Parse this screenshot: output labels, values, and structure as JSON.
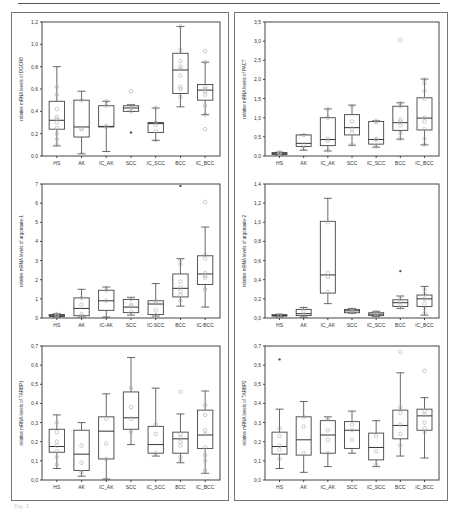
{
  "figure": {
    "caption": "Fig. 1",
    "categories": [
      "HS",
      "AK",
      "IC_AK",
      "SCC",
      "IC_SCC",
      "BCC",
      "IC_BCC"
    ]
  },
  "chart_data": [
    {
      "type": "box",
      "id": "p1",
      "ylabel": "relative mRNA levels of DGCR8",
      "ylim": [
        0,
        1.2
      ],
      "yticks": [
        "0,0",
        "0,2",
        "0,4",
        "0,6",
        "0,8",
        "1,0",
        "1,2"
      ],
      "categories": [
        "HS",
        "AK",
        "IC_AK",
        "SCC",
        "IC_SCC",
        "BCC",
        "IC_BCC"
      ],
      "boxes": [
        {
          "min": 0.09,
          "q1": 0.24,
          "median": 0.32,
          "q3": 0.49,
          "max": 0.8,
          "points": [
            0.1,
            0.15,
            0.2,
            0.25,
            0.3,
            0.33,
            0.35,
            0.42,
            0.55,
            0.62
          ],
          "outliers": []
        },
        {
          "min": 0.02,
          "q1": 0.17,
          "median": 0.26,
          "q3": 0.5,
          "max": 0.58,
          "points": [
            0.02,
            0.24,
            0.25,
            0.5
          ],
          "outliers": []
        },
        {
          "min": 0.04,
          "q1": 0.26,
          "median": 0.265,
          "q3": 0.45,
          "max": 0.49,
          "points": [
            0.26,
            0.27,
            0.45,
            0.49
          ],
          "outliers": []
        },
        {
          "min": 0.4,
          "q1": 0.4,
          "median": 0.43,
          "q3": 0.45,
          "max": 0.46,
          "points": [
            0.4,
            0.43,
            0.45,
            0.58
          ],
          "outliers": [
            0.21
          ]
        },
        {
          "min": 0.14,
          "q1": 0.21,
          "median": 0.29,
          "q3": 0.3,
          "max": 0.43,
          "points": [
            0.14,
            0.22,
            0.28,
            0.3,
            0.43
          ],
          "outliers": []
        },
        {
          "min": 0.44,
          "q1": 0.56,
          "median": 0.77,
          "q3": 0.92,
          "max": 1.16,
          "points": [
            0.53,
            0.6,
            0.62,
            0.72,
            0.78,
            0.8,
            0.85,
            0.95,
            1.16
          ],
          "outliers": []
        },
        {
          "min": 0.37,
          "q1": 0.5,
          "median": 0.59,
          "q3": 0.64,
          "max": 0.84,
          "points": [
            0.24,
            0.37,
            0.45,
            0.55,
            0.58,
            0.6,
            0.62,
            0.84,
            0.94
          ],
          "outliers": []
        }
      ]
    },
    {
      "type": "box",
      "id": "p2",
      "ylabel": "relative mRNA levels of PACT",
      "ylim": [
        0,
        3.5
      ],
      "yticks": [
        "0,0",
        "0,5",
        "1,0",
        "1,5",
        "2,0",
        "2,5",
        "3,0",
        "3,5"
      ],
      "categories": [
        "HS",
        "AK",
        "IC_AK",
        "SCC",
        "IC_SCC",
        "BCC",
        "IC_BCC"
      ],
      "boxes": [
        {
          "min": 0.03,
          "q1": 0.04,
          "median": 0.06,
          "q3": 0.09,
          "max": 0.1,
          "points": [
            0.04,
            0.06,
            0.08,
            0.1
          ],
          "outliers": []
        },
        {
          "min": 0.15,
          "q1": 0.25,
          "median": 0.33,
          "q3": 0.55,
          "max": 0.55,
          "points": [
            0.2,
            0.3,
            0.55
          ],
          "outliers": []
        },
        {
          "min": 0.13,
          "q1": 0.27,
          "median": 0.43,
          "q3": 1.0,
          "max": 1.23,
          "points": [
            0.15,
            0.4,
            0.45,
            1.0,
            1.23
          ],
          "outliers": []
        },
        {
          "min": 0.28,
          "q1": 0.55,
          "median": 0.74,
          "q3": 1.08,
          "max": 1.33,
          "points": [
            0.3,
            0.6,
            0.72,
            0.9,
            1.3
          ],
          "outliers": []
        },
        {
          "min": 0.23,
          "q1": 0.31,
          "median": 0.43,
          "q3": 0.9,
          "max": 0.92,
          "points": [
            0.25,
            0.42,
            0.45,
            0.88,
            0.92
          ],
          "outliers": []
        },
        {
          "min": 0.44,
          "q1": 0.67,
          "median": 0.87,
          "q3": 1.3,
          "max": 1.39,
          "points": [
            0.45,
            0.6,
            0.8,
            0.9,
            0.95,
            1.3,
            1.38,
            3.03
          ],
          "outliers": []
        },
        {
          "min": 0.29,
          "q1": 0.68,
          "median": 0.99,
          "q3": 1.52,
          "max": 2.01,
          "points": [
            0.3,
            0.45,
            0.7,
            0.9,
            1.0,
            1.5,
            1.7,
            1.9,
            2.0
          ],
          "outliers": []
        }
      ]
    },
    {
      "type": "box",
      "id": "p3",
      "ylabel": "relative mRNA levels of argonaute-1",
      "ylim": [
        0,
        7
      ],
      "yticks": [
        "0",
        "1",
        "2",
        "3",
        "4",
        "5",
        "6",
        "7"
      ],
      "categories": [
        "HS",
        "AK",
        "IC-AK",
        "SCC",
        "IC-SCC",
        "BCC",
        "IC-BCC"
      ],
      "boxes": [
        {
          "min": 0.05,
          "q1": 0.08,
          "median": 0.12,
          "q3": 0.18,
          "max": 0.22,
          "points": [
            0.1,
            0.15,
            0.2
          ],
          "outliers": []
        },
        {
          "min": 0.05,
          "q1": 0.12,
          "median": 0.5,
          "q3": 1.05,
          "max": 1.5,
          "points": [
            0.1,
            0.2,
            0.7,
            1.05
          ],
          "outliers": []
        },
        {
          "min": 0.05,
          "q1": 0.4,
          "median": 0.9,
          "q3": 1.45,
          "max": 1.62,
          "points": [
            0.9,
            1.45
          ],
          "outliers": []
        },
        {
          "min": 0.15,
          "q1": 0.28,
          "median": 0.57,
          "q3": 0.97,
          "max": 1.08,
          "points": [
            0.3,
            0.6,
            0.7,
            1.0
          ],
          "outliers": []
        },
        {
          "min": 0.1,
          "q1": 0.18,
          "median": 0.73,
          "q3": 0.9,
          "max": 1.8,
          "points": [
            0.15,
            0.4,
            0.85,
            0.9
          ],
          "outliers": []
        },
        {
          "min": 0.62,
          "q1": 1.1,
          "median": 1.55,
          "q3": 2.3,
          "max": 3.1,
          "points": [
            0.9,
            1.2,
            1.4,
            1.6,
            1.9,
            2.8,
            3.0
          ],
          "outliers": [
            6.9
          ]
        },
        {
          "min": 0.57,
          "q1": 1.75,
          "median": 2.3,
          "q3": 3.25,
          "max": 4.75,
          "points": [
            1.5,
            2.1,
            2.2,
            2.35,
            3.1,
            3.3,
            6.05
          ],
          "outliers": []
        }
      ]
    },
    {
      "type": "box",
      "id": "p4",
      "ylabel": "relative mRNA levels of argonaute-2",
      "ylim": [
        0,
        1.4
      ],
      "yticks": [
        "0,0",
        "0,2",
        "0,4",
        "0,6",
        "0,8",
        "1,0",
        "1,2",
        "1,4"
      ],
      "categories": [
        "HS",
        "AK",
        "IC_AK",
        "SCC",
        "IC_SCC",
        "BCC",
        "IC_BCC"
      ],
      "boxes": [
        {
          "min": 0.01,
          "q1": 0.02,
          "median": 0.025,
          "q3": 0.035,
          "max": 0.04,
          "points": [
            0.02,
            0.03
          ],
          "outliers": []
        },
        {
          "min": 0.01,
          "q1": 0.025,
          "median": 0.045,
          "q3": 0.09,
          "max": 0.11,
          "points": [
            0.03,
            0.07,
            0.1
          ],
          "outliers": []
        },
        {
          "min": 0.15,
          "q1": 0.26,
          "median": 0.45,
          "q3": 1.01,
          "max": 1.25,
          "points": [
            0.27,
            0.43,
            0.47,
            1.0
          ],
          "outliers": []
        },
        {
          "min": 0.05,
          "q1": 0.055,
          "median": 0.075,
          "q3": 0.09,
          "max": 0.1,
          "points": [
            0.06,
            0.08,
            0.09
          ],
          "outliers": []
        },
        {
          "min": 0.015,
          "q1": 0.025,
          "median": 0.04,
          "q3": 0.055,
          "max": 0.07,
          "points": [
            0.02,
            0.04,
            0.06
          ],
          "outliers": []
        },
        {
          "min": 0.1,
          "q1": 0.12,
          "median": 0.16,
          "q3": 0.19,
          "max": 0.23,
          "points": [
            0.11,
            0.14,
            0.17,
            0.2
          ],
          "outliers": [
            0.49
          ]
        },
        {
          "min": 0.03,
          "q1": 0.12,
          "median": 0.2,
          "q3": 0.24,
          "max": 0.33,
          "points": [
            0.05,
            0.1,
            0.15,
            0.2,
            0.25,
            0.3
          ],
          "outliers": []
        }
      ]
    },
    {
      "type": "box",
      "id": "p5",
      "ylabel": "relative mRNA levels of TARBP1",
      "ylim": [
        0,
        0.7
      ],
      "yticks": [
        "0,0",
        "0,1",
        "0,2",
        "0,3",
        "0,4",
        "0,5",
        "0,6",
        "0,7"
      ],
      "categories": [
        "HS",
        "AK",
        "IC_AK",
        "SCC",
        "IC_SCC",
        "BCC",
        "IC_BCC"
      ],
      "boxes": [
        {
          "min": 0.06,
          "q1": 0.145,
          "median": 0.175,
          "q3": 0.265,
          "max": 0.34,
          "points": [
            0.08,
            0.12,
            0.15,
            0.18,
            0.2,
            0.25,
            0.3
          ],
          "outliers": []
        },
        {
          "min": 0.02,
          "q1": 0.05,
          "median": 0.135,
          "q3": 0.26,
          "max": 0.3,
          "points": [
            0.04,
            0.09,
            0.18
          ],
          "outliers": []
        },
        {
          "min": 0.005,
          "q1": 0.11,
          "median": 0.255,
          "q3": 0.33,
          "max": 0.45,
          "points": [
            0.11,
            0.19,
            0.32
          ],
          "outliers": []
        },
        {
          "min": 0.185,
          "q1": 0.265,
          "median": 0.325,
          "q3": 0.46,
          "max": 0.64,
          "points": [
            0.25,
            0.32,
            0.38,
            0.48
          ],
          "outliers": []
        },
        {
          "min": 0.125,
          "q1": 0.14,
          "median": 0.185,
          "q3": 0.28,
          "max": 0.48,
          "points": [
            0.14,
            0.24,
            0.29
          ],
          "outliers": []
        },
        {
          "min": 0.09,
          "q1": 0.14,
          "median": 0.215,
          "q3": 0.25,
          "max": 0.345,
          "points": [
            0.1,
            0.12,
            0.18,
            0.2,
            0.22,
            0.24,
            0.46
          ],
          "outliers": []
        },
        {
          "min": 0.035,
          "q1": 0.165,
          "median": 0.235,
          "q3": 0.365,
          "max": 0.465,
          "points": [
            0.05,
            0.1,
            0.13,
            0.17,
            0.24,
            0.26,
            0.34,
            0.39
          ],
          "outliers": []
        }
      ]
    },
    {
      "type": "box",
      "id": "p6",
      "ylabel": "relative mRNA levels of TARBP2",
      "ylim": [
        0,
        0.7
      ],
      "yticks": [
        "0,0",
        "0,1",
        "0,2",
        "0,3",
        "0,4",
        "0,5",
        "0,6",
        "0,7"
      ],
      "categories": [
        "HS",
        "AK",
        "IC_AK",
        "SCC",
        "IC_SCC",
        "BCC",
        "IC_BCC"
      ],
      "boxes": [
        {
          "min": 0.06,
          "q1": 0.135,
          "median": 0.175,
          "q3": 0.25,
          "max": 0.37,
          "points": [
            0.11,
            0.16,
            0.18,
            0.23,
            0.27
          ],
          "outliers": [
            0.63
          ]
        },
        {
          "min": 0.04,
          "q1": 0.13,
          "median": 0.21,
          "q3": 0.33,
          "max": 0.41,
          "points": [
            0.14,
            0.28,
            0.33
          ],
          "outliers": []
        },
        {
          "min": 0.07,
          "q1": 0.14,
          "median": 0.235,
          "q3": 0.31,
          "max": 0.33,
          "points": [
            0.14,
            0.21,
            0.26,
            0.32
          ],
          "outliers": []
        },
        {
          "min": 0.14,
          "q1": 0.165,
          "median": 0.26,
          "q3": 0.305,
          "max": 0.36,
          "points": [
            0.21,
            0.26,
            0.29
          ],
          "outliers": []
        },
        {
          "min": 0.07,
          "q1": 0.105,
          "median": 0.17,
          "q3": 0.245,
          "max": 0.31,
          "points": [
            0.08,
            0.15,
            0.23
          ],
          "outliers": []
        },
        {
          "min": 0.125,
          "q1": 0.215,
          "median": 0.285,
          "q3": 0.365,
          "max": 0.56,
          "points": [
            0.18,
            0.24,
            0.29,
            0.35,
            0.38,
            0.67
          ],
          "outliers": []
        },
        {
          "min": 0.115,
          "q1": 0.26,
          "median": 0.335,
          "q3": 0.37,
          "max": 0.43,
          "points": [
            0.25,
            0.27,
            0.3,
            0.34,
            0.36,
            0.57
          ],
          "outliers": []
        }
      ]
    }
  ]
}
